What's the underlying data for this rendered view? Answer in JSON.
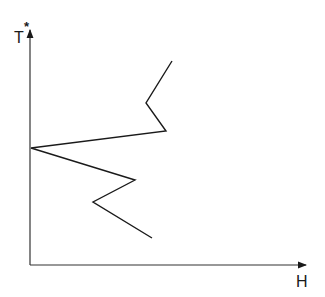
{
  "diagram": {
    "y_axis": {
      "label": "T",
      "superscript": "*"
    },
    "x_axis": {
      "label": "H"
    },
    "origin": [
      30,
      265
    ],
    "y_axis_top": [
      30,
      28
    ],
    "x_axis_end": [
      308,
      265
    ],
    "curve_points": "172,61 146,103 166,131 31,148 135,180 93,202 152,238",
    "line_color": "#1a1a1a"
  }
}
